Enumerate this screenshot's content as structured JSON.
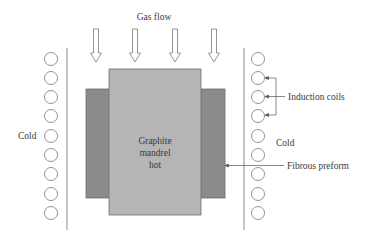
{
  "labels": {
    "gas_flow": "Gas flow",
    "cold_left": "Cold",
    "cold_right": "Cold",
    "induction_coils": "Induction coils",
    "fibrous_preform": "Fibrous preform",
    "mandrel_line1": "Graphite",
    "mandrel_line2": "mandrel",
    "mandrel_line3": "hot"
  },
  "colors": {
    "mandrel_fill": "#b5b5b5",
    "preform_fill": "#8b8b8b",
    "outline": "#6f6f6f",
    "line": "#8a8a8a",
    "text": "#3a3a3a"
  },
  "gas_flow_arrows": [
    96,
    135,
    175,
    214
  ],
  "coil_rows_y": [
    59,
    78,
    97,
    116,
    136,
    155,
    174,
    194,
    213
  ]
}
